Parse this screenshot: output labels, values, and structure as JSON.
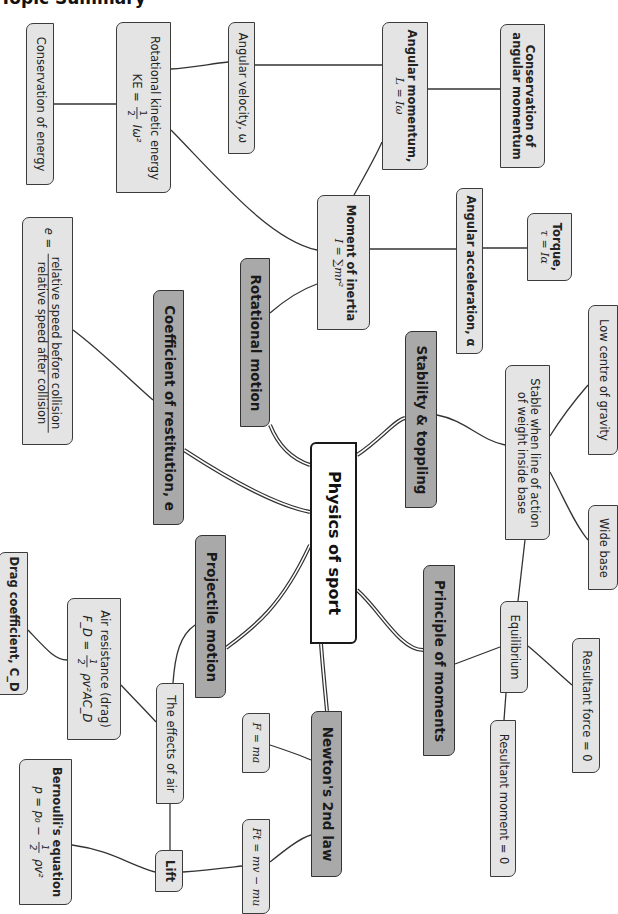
{
  "title": "Topic Summary",
  "colors": {
    "node_fill": "#e4e4e4",
    "category_fill": "#a9a9a9",
    "center_fill": "#ffffff",
    "border": "#3c3c3c",
    "link": "#333333"
  },
  "center": {
    "label": "Physics of sport"
  },
  "categories": {
    "rotational_motion": "Rotational motion",
    "coefficient_of_restitution": "Coefficient of restitution, e",
    "projectile_motion": "Projectile motion",
    "newtons_2nd_law": "Newton's 2nd law",
    "principle_of_moments": "Principle of moments",
    "stability_toppling": "Stability & toppling"
  },
  "nodes": {
    "conservation_of_energy": "Conservation of energy",
    "rotational_ke": {
      "label": "Rotational kinetic energy",
      "formula_lhs": "KE =",
      "frac_num": "1",
      "frac_den": "2",
      "formula_rhs": "Iω²"
    },
    "angular_velocity": "Angular velocity, ω",
    "angular_momentum": {
      "label": "Angular momentum,",
      "formula": "L = Iω"
    },
    "conservation_angular_momentum": {
      "line1": "Conservation of",
      "line2": "angular momentum"
    },
    "moment_of_inertia": {
      "label": "Moment of inertia",
      "formula": "I = ∑mr²"
    },
    "angular_acceleration": "Angular acceleration, α",
    "torque": {
      "label": "Torque,",
      "formula": "τ = Iα"
    },
    "restitution_formula": {
      "lhs": "e =",
      "numerator": "relative speed before collision",
      "denominator": "relative speed after collision"
    },
    "low_centre_of_gravity": "Low centre of gravity",
    "stable_when": {
      "line1": "Stable when line of action",
      "line2": "of weight inside base"
    },
    "wide_base": "Wide base",
    "equilibrium": "Equilibrium",
    "resultant_force": "Resultant force = 0",
    "resultant_moment": "Resultant moment = 0",
    "f_ma": "F = ma",
    "ft_impulse": "Ft = mv − mu",
    "effects_of_air": "The effects of air",
    "air_resistance": {
      "label": "Air resistance (drag)",
      "formula_lhs": "F_D =",
      "frac_num": "1",
      "frac_den": "2",
      "formula_rhs": "ρv²AC_D"
    },
    "drag_coefficient": "Drag coefficient, C_D",
    "lift": "Lift",
    "bernoulli": {
      "label": "Bernoulli's equation",
      "formula_lhs": "p = p₀ −",
      "frac_num": "1",
      "frac_den": "2",
      "formula_rhs": "ρv²"
    }
  }
}
